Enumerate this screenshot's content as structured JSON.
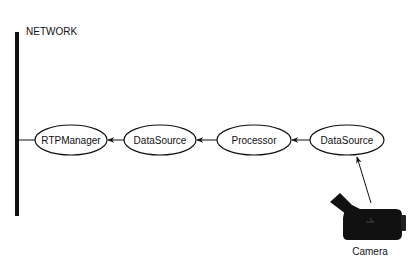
{
  "network": {
    "label": "NETWORK"
  },
  "nodes": [
    {
      "id": "rtpmanager",
      "label": "RTPManager",
      "cx": 71,
      "cy": 140,
      "rx": 36,
      "ry": 15
    },
    {
      "id": "datasource-1",
      "label": "DataSource",
      "cx": 160,
      "cy": 140,
      "rx": 36,
      "ry": 15
    },
    {
      "id": "processor",
      "label": "Processor",
      "cx": 254,
      "cy": 140,
      "rx": 37,
      "ry": 15
    },
    {
      "id": "datasource-2",
      "label": "DataSource",
      "cx": 347,
      "cy": 140,
      "rx": 37,
      "ry": 15
    }
  ],
  "camera": {
    "label": "Camera"
  },
  "colors": {
    "stroke": "#111111",
    "fill": "#ffffff",
    "camera": "#111111"
  }
}
